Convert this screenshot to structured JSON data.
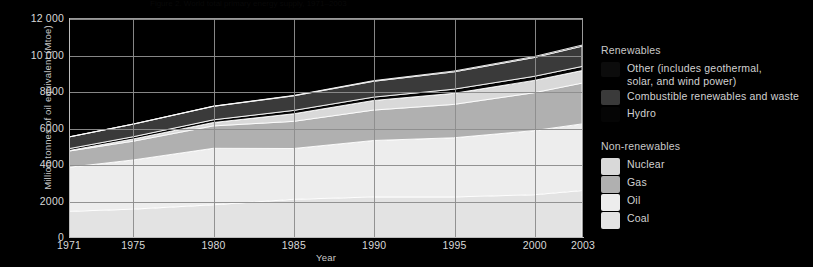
{
  "header": {
    "caption": "Figure 2.  World total primary energy supply, 1971–2003"
  },
  "chart_data": {
    "type": "area",
    "stacked": true,
    "title": "",
    "xlabel": "Year",
    "ylabel": "Million tonnes of oil equivalent (Mtoe)",
    "xlim": [
      1971,
      2003
    ],
    "ylim": [
      0,
      12000
    ],
    "yticks": [
      0,
      2000,
      4000,
      6000,
      8000,
      10000,
      12000
    ],
    "ytick_labels": [
      "0",
      "2000",
      "4000",
      "6000",
      "8000",
      "10 000",
      "12 000"
    ],
    "xticks": [
      1971,
      1975,
      1980,
      1985,
      1990,
      1995,
      2000,
      2003
    ],
    "xtick_labels": [
      "1971",
      "1975",
      "1980",
      "1985",
      "1990",
      "1995",
      "2000",
      "2003"
    ],
    "grid": true,
    "grid_color": "#8d8d8d",
    "legend_position": "right",
    "background": "#000000",
    "x": [
      1971,
      1975,
      1980,
      1985,
      1990,
      1995,
      2000,
      2003
    ],
    "series": [
      {
        "name": "Coal",
        "color": "#e3e3e3",
        "values": [
          1440,
          1560,
          1800,
          2100,
          2230,
          2230,
          2350,
          2580
        ]
      },
      {
        "name": "Oil",
        "color": "#ededed",
        "values": [
          2420,
          2700,
          3100,
          2790,
          3100,
          3250,
          3520,
          3660
        ]
      },
      {
        "name": "Gas",
        "color": "#b0b0b0",
        "values": [
          890,
          1030,
          1230,
          1490,
          1670,
          1830,
          2080,
          2240
        ]
      },
      {
        "name": "Nuclear",
        "color": "#d9d9d9",
        "values": [
          29,
          120,
          186,
          415,
          526,
          608,
          675,
          687
        ]
      },
      {
        "name": "Hydro",
        "color": "#050505",
        "values": [
          104,
          125,
          148,
          184,
          184,
          228,
          225,
          227
        ]
      },
      {
        "name": "Combustible renewables and waste",
        "color": "#3a3a3a",
        "values": [
          640,
          690,
          740,
          800,
          870,
          950,
          1030,
          1110
        ]
      },
      {
        "name": "Other (includes geothermal, solar, and wind power)",
        "color": "#0c0c0c",
        "values": [
          4,
          8,
          12,
          22,
          36,
          45,
          55,
          63
        ]
      }
    ],
    "totals": [
      5527,
      6233,
      7216,
      7801,
      8616,
      9141,
      9935,
      10567
    ]
  },
  "legend": {
    "groups": [
      {
        "title": "Renewables",
        "items": [
          {
            "label_line1": "Other (includes geothermal,",
            "label_line2": "solar, and wind power)",
            "color": "#0c0c0c"
          },
          {
            "label_line1": "Combustible renewables and waste",
            "label_line2": "",
            "color": "#3a3a3a"
          },
          {
            "label_line1": "Hydro",
            "label_line2": "",
            "color": "#050505"
          }
        ]
      },
      {
        "title": "Non-renewables",
        "items": [
          {
            "label_line1": "Nuclear",
            "label_line2": "",
            "color": "#d9d9d9"
          },
          {
            "label_line1": "Gas",
            "label_line2": "",
            "color": "#b0b0b0"
          },
          {
            "label_line1": "Oil",
            "label_line2": "",
            "color": "#ededed"
          },
          {
            "label_line1": "Coal",
            "label_line2": "",
            "color": "#e3e3e3"
          }
        ]
      }
    ]
  }
}
